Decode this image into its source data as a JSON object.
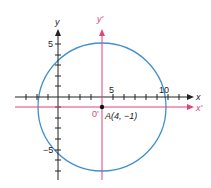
{
  "figure": {
    "type": "coordinate-translation-diagram",
    "original_axes": {
      "x_label": "x",
      "y_label": "y",
      "color": "#222222"
    },
    "translated_axes": {
      "x_label": "x'",
      "y_label": "y'",
      "origin_label": "0'",
      "color": "#e0457a"
    },
    "tick_labels": {
      "x_5": "5",
      "x_10": "10",
      "y_5": "5",
      "y_neg5": "−5"
    },
    "center_point": {
      "label": "A(4, −1)",
      "x": 4,
      "y": -1
    },
    "circle": {
      "center": [
        4,
        -1
      ],
      "radius": 6,
      "color": "#3f8fd2"
    }
  }
}
